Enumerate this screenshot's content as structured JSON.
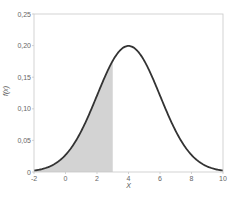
{
  "chart_data": {
    "type": "area",
    "title": "",
    "xlabel": "X",
    "ylabel": "f(x)",
    "xlim": [
      -2,
      10
    ],
    "ylim": [
      0,
      0.25
    ],
    "x_ticks": [
      "-2",
      "0",
      "2",
      "4",
      "6",
      "8",
      "10"
    ],
    "x_tick_values": [
      -2,
      0,
      2,
      4,
      6,
      8,
      10
    ],
    "y_ticks": [
      "0",
      "0,05",
      "0,10",
      "0,15",
      "0,20",
      "0,25"
    ],
    "y_tick_values": [
      0,
      0.05,
      0.1,
      0.15,
      0.2,
      0.25
    ],
    "grid": false,
    "legend": null,
    "series": [
      {
        "name": "Normal density N(mean=4, sd=2)",
        "distribution": "normal",
        "mean": 4,
        "sd": 2,
        "peak_value": 0.1995,
        "x": [
          -2,
          -1,
          0,
          1,
          2,
          3,
          4,
          5,
          6,
          7,
          8,
          9,
          10
        ],
        "values": [
          0.0022,
          0.0088,
          0.027,
          0.0648,
          0.121,
          0.176,
          0.1995,
          0.176,
          0.121,
          0.0648,
          0.027,
          0.0088,
          0.0022
        ]
      }
    ],
    "shaded_region": {
      "from": -2,
      "to": 3,
      "label": "P(X ≤ 3)"
    },
    "colors": {
      "curve": "#333333",
      "shade": "#d3d3d3",
      "frame": "#c8c8c8",
      "tick_text": "#666666"
    }
  }
}
